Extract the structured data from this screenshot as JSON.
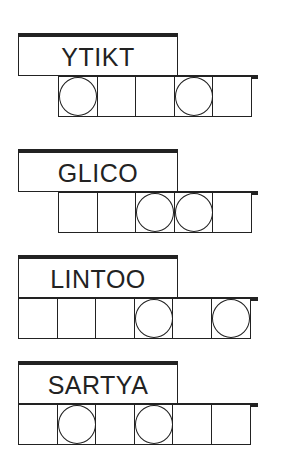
{
  "puzzles": [
    {
      "scrambled": "YTIKT",
      "cells": 5,
      "circled": [
        0,
        3
      ],
      "top": 33
    },
    {
      "scrambled": "GLICO",
      "cells": 5,
      "circled": [
        2,
        3
      ],
      "top": 149
    },
    {
      "scrambled": "LINTOO",
      "cells": 6,
      "circled": [
        3,
        5
      ],
      "top": 255
    },
    {
      "scrambled": "SARTYA",
      "cells": 6,
      "circled": [
        1,
        3
      ],
      "top": 361
    }
  ],
  "colors": {
    "ink": "#222222",
    "background": "#ffffff"
  }
}
